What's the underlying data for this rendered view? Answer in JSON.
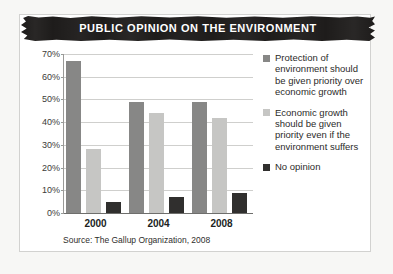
{
  "banner": {
    "title": "PUBLIC OPINION ON THE ENVIRONMENT"
  },
  "source": {
    "text": "Source: The Gallup Organization, 2008"
  },
  "colors": {
    "series_protection": "#878786",
    "series_economic": "#c6c6c4",
    "series_no_opinion": "#302f2e",
    "banner_background": "#1e1c1b",
    "banner_text": "#ffffff",
    "gridline": "#cfcfcd",
    "card_background": "#ffffff",
    "page_background": "#f7f7f5"
  },
  "chart_data": {
    "type": "bar",
    "title": "PUBLIC OPINION ON THE ENVIRONMENT",
    "xlabel": "",
    "ylabel": "",
    "categories": [
      "2000",
      "2004",
      "2008"
    ],
    "ylim": [
      0,
      70
    ],
    "ytick_labels": [
      "0%",
      "10%",
      "20%",
      "30%",
      "40%",
      "50%",
      "60%",
      "70%"
    ],
    "ytick_values": [
      0,
      10,
      20,
      30,
      40,
      50,
      60,
      70
    ],
    "grid": true,
    "legend_position": "right",
    "series": [
      {
        "name": "Protection of environment should be given priority over economic growth",
        "color": "#878786",
        "values": [
          67,
          49,
          49
        ]
      },
      {
        "name": "Economic growth should be given priority even if the environment suffers",
        "color": "#c6c6c4",
        "values": [
          28,
          44,
          42
        ]
      },
      {
        "name": "No opinion",
        "color": "#302f2e",
        "values": [
          5,
          7,
          9
        ]
      }
    ],
    "annotations": [
      "Source: The Gallup Organization, 2008"
    ]
  }
}
